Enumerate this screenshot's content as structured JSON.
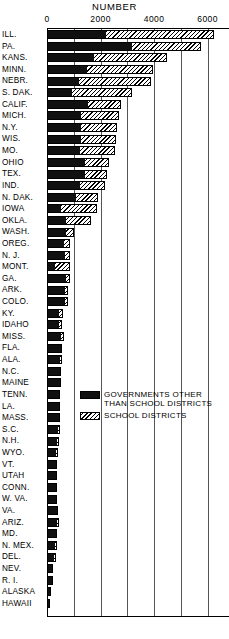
{
  "chart_data": {
    "type": "bar",
    "orientation": "horizontal",
    "stacked": true,
    "title": "NUMBER",
    "xlabel": "NUMBER",
    "ylabel": "",
    "xlim": [
      0,
      6800
    ],
    "xticks": [
      0,
      2000,
      4000,
      6000
    ],
    "xtick_labels": [
      "0",
      "2000",
      "4000",
      "6000"
    ],
    "gridlines": [
      0,
      1000,
      2000,
      3000,
      4000,
      5000,
      6000
    ],
    "grid": true,
    "legend_position": "center-right",
    "categories": [
      "ILL.",
      "PA.",
      "KANS.",
      "MINN.",
      "NEBR.",
      "S. DAK.",
      "CALIF.",
      "MICH.",
      "N.Y.",
      "WIS.",
      "MO.",
      "OHIO",
      "TEX.",
      "IND.",
      "N. DAK.",
      "IOWA",
      "OKLA.",
      "WASH.",
      "OREG.",
      "N. J.",
      "MONT.",
      "GA.",
      "ARK.",
      "COLO.",
      "KY.",
      "IDAHO",
      "MISS.",
      "FLA.",
      "ALA.",
      "N.C.",
      "MAINE",
      "TENN.",
      "LA.",
      "MASS.",
      "S.C.",
      "N.H.",
      "WYO.",
      "VT.",
      "UTAH",
      "CONN.",
      "W. VA.",
      "VA.",
      "ARIZ.",
      "MD.",
      "N. MEX.",
      "DEL.",
      "NEV.",
      "R. I.",
      "ALASKA",
      "HAWAII"
    ],
    "series": [
      {
        "name": "GOVERNMENTS OTHER THAN SCHOOL DISTRICTS",
        "color": "#101010",
        "values": [
          2150,
          3150,
          1700,
          1450,
          1150,
          880,
          1500,
          1230,
          1230,
          1230,
          1200,
          1380,
          1370,
          1180,
          1050,
          500,
          660,
          690,
          590,
          630,
          250,
          680,
          640,
          630,
          420,
          400,
          500,
          480,
          450,
          530,
          500,
          480,
          420,
          400,
          390,
          340,
          300,
          370,
          330,
          330,
          320,
          350,
          330,
          320,
          280,
          220,
          200,
          190,
          140,
          100
        ]
      },
      {
        "name": "SCHOOL DISTRICTS",
        "color": "#f2f2f2",
        "hatch": "diagonal",
        "values": [
          4100,
          2600,
          2800,
          2500,
          2750,
          2300,
          1250,
          1450,
          1400,
          1350,
          1350,
          950,
          870,
          1000,
          870,
          1350,
          1000,
          320,
          260,
          230,
          600,
          180,
          160,
          160,
          190,
          150,
          130,
          80,
          120,
          10,
          10,
          20,
          80,
          90,
          100,
          120,
          120,
          10,
          60,
          60,
          60,
          60,
          110,
          70,
          100,
          100,
          30,
          20,
          10,
          10
        ]
      }
    ]
  },
  "legend": {
    "items": [
      {
        "swatch": "dark",
        "line1": "GOVERNMENTS OTHER",
        "line2": "THAN SCHOOL DISTRICTS"
      },
      {
        "swatch": "hatch",
        "line1": "SCHOOL DISTRICTS",
        "line2": ""
      }
    ]
  }
}
